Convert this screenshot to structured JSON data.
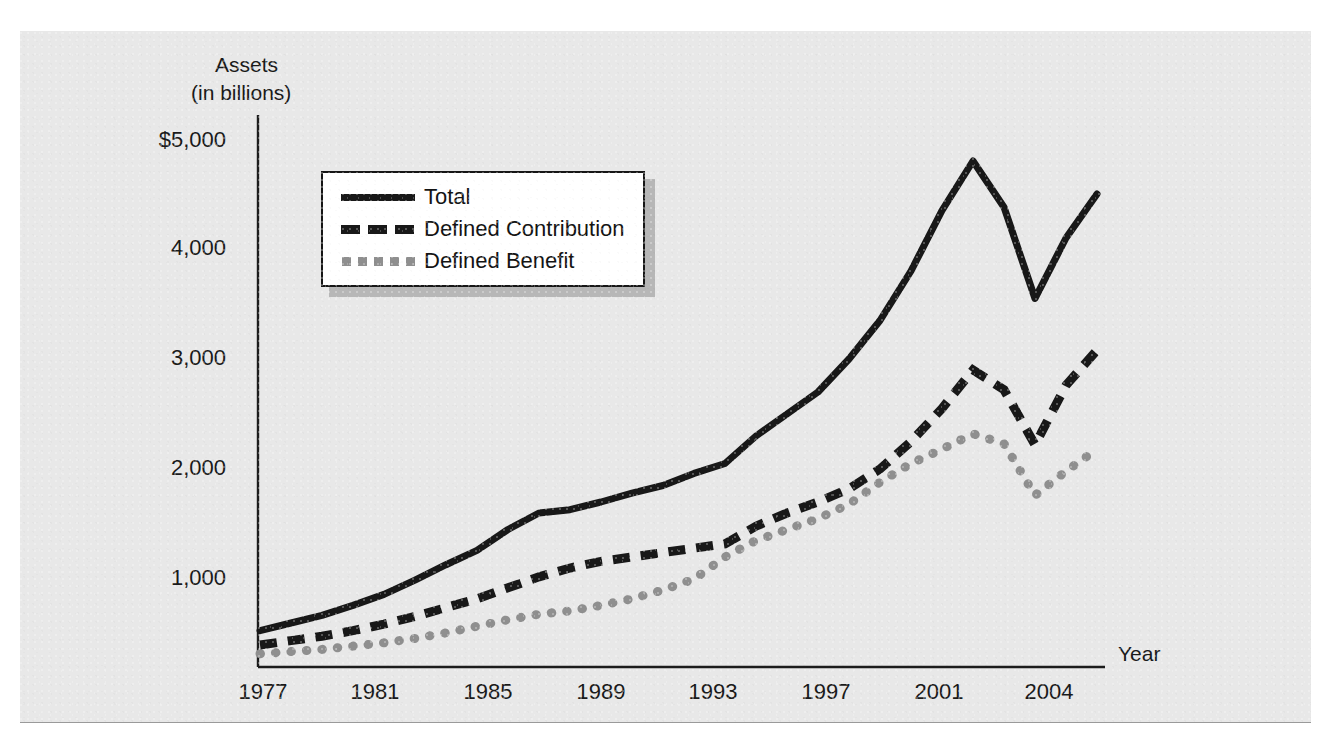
{
  "figure": {
    "top_bleed_text": "",
    "background_color": "#e8e8e8"
  },
  "axes": {
    "y_title_line1": "Assets",
    "y_title_line2": "(in billions)",
    "x_title": "Year",
    "y_tick_labels": [
      "$5,000",
      "4,000",
      "3,000",
      "2,000",
      "1,000"
    ],
    "x_tick_labels": [
      "1977",
      "1981",
      "1985",
      "1989",
      "1993",
      "1997",
      "2001",
      "2004"
    ]
  },
  "legend": {
    "items": [
      {
        "label": "Total",
        "style": "solid",
        "color": "#181818"
      },
      {
        "label": "Defined Contribution",
        "style": "dashed",
        "color": "#181818"
      },
      {
        "label": "Defined Benefit",
        "style": "dotted",
        "color": "#8f8f8f"
      }
    ]
  },
  "chart_data": {
    "type": "line",
    "title": "",
    "xlabel": "Year",
    "ylabel": "Assets (in billions)",
    "xlim": [
      1977,
      2004
    ],
    "ylim": [
      0,
      5000
    ],
    "grid": false,
    "legend_position": "top-left",
    "y_ticks": [
      1000,
      2000,
      3000,
      4000,
      5000
    ],
    "x_ticks": [
      1977,
      1981,
      1985,
      1989,
      1993,
      1997,
      2001,
      2004
    ],
    "x": [
      1977,
      1978,
      1979,
      1980,
      1981,
      1982,
      1983,
      1984,
      1985,
      1986,
      1987,
      1988,
      1989,
      1990,
      1991,
      1992,
      1993,
      1994,
      1995,
      1996,
      1997,
      1998,
      1999,
      2000,
      2001,
      2002,
      2003,
      2004
    ],
    "series": [
      {
        "name": "Total",
        "style": "solid",
        "color": "#181818",
        "values": [
          330,
          400,
          470,
          560,
          660,
          790,
          930,
          1060,
          1250,
          1400,
          1430,
          1500,
          1580,
          1650,
          1760,
          1850,
          2100,
          2300,
          2500,
          2800,
          3150,
          3600,
          4150,
          4600,
          4180,
          3350,
          3900,
          4300
        ]
      },
      {
        "name": "Defined Contribution",
        "style": "dashed",
        "color": "#181818",
        "values": [
          200,
          240,
          280,
          330,
          390,
          460,
          540,
          620,
          720,
          820,
          900,
          960,
          1000,
          1040,
          1080,
          1120,
          1280,
          1400,
          1500,
          1620,
          1800,
          2050,
          2350,
          2700,
          2520,
          2020,
          2560,
          2880
        ]
      },
      {
        "name": "Defined Benefit",
        "style": "dotted",
        "color": "#8f8f8f",
        "values": [
          120,
          140,
          160,
          190,
          220,
          260,
          310,
          370,
          430,
          480,
          510,
          560,
          620,
          700,
          800,
          1000,
          1150,
          1250,
          1350,
          1480,
          1680,
          1850,
          1980,
          2120,
          2030,
          1560,
          1780,
          1980
        ]
      }
    ]
  }
}
